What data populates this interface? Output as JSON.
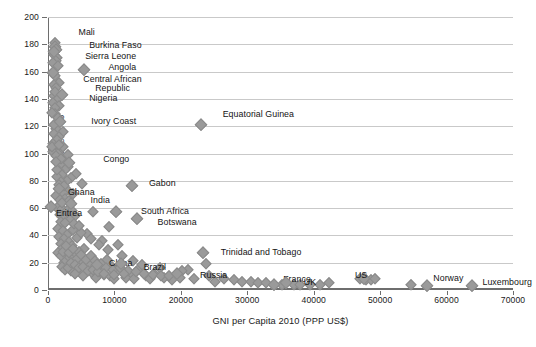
{
  "chart_data": {
    "type": "scatter",
    "title": "",
    "xlabel": "GNI per Capita 2010 (PPP US$)",
    "ylabel": "Under 5 Mortality Rate 2010",
    "xlim": [
      0,
      70000
    ],
    "ylim": [
      0,
      200
    ],
    "xticks": [
      0,
      10000,
      20000,
      30000,
      40000,
      50000,
      60000,
      70000
    ],
    "yticks": [
      0,
      20,
      40,
      60,
      80,
      100,
      120,
      140,
      160,
      180,
      200
    ],
    "xticklabels": [
      "0",
      "10000",
      "20000",
      "30000",
      "40000",
      "50000",
      "60000",
      "70000"
    ],
    "yticklabels": [
      "0",
      "20",
      "40",
      "60",
      "80",
      "100",
      "120",
      "140",
      "160",
      "180",
      "200"
    ],
    "grid": "horizontal",
    "legend": "none",
    "marker": "diamond",
    "marker_color": "#9a9a9a",
    "annotations": [
      {
        "label": "Mali",
        "x": 1030,
        "y": 178,
        "lx": 4600,
        "ly": 188,
        "align": "left"
      },
      {
        "label": "Burkina Faso",
        "x": 1250,
        "y": 176,
        "lx": 6200,
        "ly": 179,
        "align": "left"
      },
      {
        "label": "Sierra Leone",
        "x": 830,
        "y": 174,
        "lx": 5600,
        "ly": 171,
        "align": "left"
      },
      {
        "label": "Angola",
        "x": 5360,
        "y": 161,
        "lx": 9100,
        "ly": 163,
        "align": "left"
      },
      {
        "label": "Central African Republic",
        "x": 790,
        "y": 159,
        "lx": 5200,
        "ly": 154,
        "align": "left"
      },
      {
        "label": "Nigeria",
        "x": 2160,
        "y": 143,
        "lx": 6200,
        "ly": 140,
        "align": "left"
      },
      {
        "label": "Ivory Coast",
        "x": 1800,
        "y": 123,
        "lx": 6500,
        "ly": 123,
        "align": "left"
      },
      {
        "label": "Equatorial Guinea",
        "x": 23000,
        "y": 121,
        "lx": 26300,
        "ly": 128,
        "align": "left"
      },
      {
        "label": "Congo",
        "x": 3150,
        "y": 93,
        "lx": 8300,
        "ly": 95,
        "align": "left"
      },
      {
        "label": "Gabon",
        "x": 12600,
        "y": 76,
        "lx": 15200,
        "ly": 78,
        "align": "left"
      },
      {
        "label": "Ghana",
        "x": 1600,
        "y": 74,
        "lx": 3000,
        "ly": 71,
        "align": "left"
      },
      {
        "label": "India",
        "x": 3400,
        "y": 63,
        "lx": 6400,
        "ly": 65,
        "align": "left"
      },
      {
        "label": "Eritrea",
        "x": 520,
        "y": 61,
        "lx": 1200,
        "ly": 56,
        "align": "left"
      },
      {
        "label": "South Africa",
        "x": 10300,
        "y": 57,
        "lx": 14000,
        "ly": 57,
        "align": "left"
      },
      {
        "label": "Botswana",
        "x": 13400,
        "y": 52,
        "lx": 16500,
        "ly": 49,
        "align": "left"
      },
      {
        "label": "Trinidad and Tobago",
        "x": 23300,
        "y": 27,
        "lx": 26000,
        "ly": 27,
        "align": "left"
      },
      {
        "label": "China",
        "x": 7400,
        "y": 18,
        "lx": 9200,
        "ly": 19,
        "align": "left"
      },
      {
        "label": "Brazil",
        "x": 11000,
        "y": 19,
        "lx": 14400,
        "ly": 16,
        "align": "left"
      },
      {
        "label": "Russia",
        "x": 19400,
        "y": 12,
        "lx": 22900,
        "ly": 10,
        "align": "left"
      },
      {
        "label": "France",
        "x": 34000,
        "y": 4,
        "lx": 35400,
        "ly": 7,
        "align": "left"
      },
      {
        "label": "UK",
        "x": 35900,
        "y": 5,
        "lx": 38500,
        "ly": 5,
        "align": "left"
      },
      {
        "label": "US",
        "x": 47500,
        "y": 8,
        "lx": 46200,
        "ly": 10,
        "align": "left"
      },
      {
        "label": "Norway",
        "x": 57000,
        "y": 3,
        "lx": 58000,
        "ly": 8,
        "align": "left"
      },
      {
        "label": "Luxembourg",
        "x": 63800,
        "y": 3,
        "lx": 65400,
        "ly": 5,
        "align": "left"
      }
    ],
    "points": [
      [
        1030,
        178
      ],
      [
        1250,
        176
      ],
      [
        830,
        174
      ],
      [
        1100,
        181
      ],
      [
        900,
        172
      ],
      [
        1350,
        170
      ],
      [
        1150,
        168
      ],
      [
        760,
        166
      ],
      [
        1500,
        164
      ],
      [
        5360,
        161
      ],
      [
        790,
        159
      ],
      [
        1000,
        157
      ],
      [
        1700,
        152
      ],
      [
        950,
        150
      ],
      [
        1250,
        148
      ],
      [
        2160,
        143
      ],
      [
        870,
        142
      ],
      [
        1450,
        140
      ],
      [
        700,
        137
      ],
      [
        1600,
        135
      ],
      [
        1080,
        133
      ],
      [
        980,
        129
      ],
      [
        1800,
        123
      ],
      [
        23000,
        121
      ],
      [
        1150,
        118
      ],
      [
        2200,
        116
      ],
      [
        900,
        114
      ],
      [
        1600,
        112
      ],
      [
        1300,
        110
      ],
      [
        820,
        107
      ],
      [
        1050,
        104
      ],
      [
        2000,
        103
      ],
      [
        750,
        101
      ],
      [
        1450,
        100
      ],
      [
        1150,
        98
      ],
      [
        3150,
        93
      ],
      [
        2400,
        92
      ],
      [
        1900,
        91
      ],
      [
        3000,
        90
      ],
      [
        2600,
        88
      ],
      [
        1700,
        87
      ],
      [
        4200,
        85
      ],
      [
        2100,
        84
      ],
      [
        1350,
        83
      ],
      [
        3400,
        82
      ],
      [
        2800,
        80
      ],
      [
        1900,
        79
      ],
      [
        5100,
        78
      ],
      [
        1600,
        77
      ],
      [
        12600,
        76
      ],
      [
        1600,
        74
      ],
      [
        2900,
        73
      ],
      [
        2200,
        71
      ],
      [
        3700,
        70
      ],
      [
        1200,
        69
      ],
      [
        2500,
        67
      ],
      [
        1850,
        66
      ],
      [
        3100,
        65
      ],
      [
        3400,
        63
      ],
      [
        520,
        61
      ],
      [
        1400,
        60
      ],
      [
        2100,
        59
      ],
      [
        6700,
        57
      ],
      [
        10300,
        57
      ],
      [
        2700,
        56
      ],
      [
        1750,
        55
      ],
      [
        4000,
        54
      ],
      [
        2300,
        53
      ],
      [
        13400,
        52
      ],
      [
        3300,
        51
      ],
      [
        1900,
        50
      ],
      [
        2600,
        49
      ],
      [
        9200,
        46
      ],
      [
        1550,
        45
      ],
      [
        3800,
        44
      ],
      [
        2200,
        43
      ],
      [
        5900,
        41
      ],
      [
        2900,
        40
      ],
      [
        1700,
        39
      ],
      [
        4400,
        38
      ],
      [
        2400,
        37
      ],
      [
        8200,
        36
      ],
      [
        3100,
        35
      ],
      [
        1950,
        34
      ],
      [
        10500,
        33
      ],
      [
        3600,
        32
      ],
      [
        2200,
        31
      ],
      [
        5400,
        30
      ],
      [
        23300,
        27
      ],
      [
        1500,
        27
      ],
      [
        4100,
        26
      ],
      [
        2700,
        25
      ],
      [
        6500,
        24
      ],
      [
        3300,
        23
      ],
      [
        8900,
        22
      ],
      [
        4700,
        21
      ],
      [
        2400,
        20
      ],
      [
        7400,
        18
      ],
      [
        5100,
        19
      ],
      [
        3700,
        18
      ],
      [
        9600,
        17
      ],
      [
        2900,
        17
      ],
      [
        6100,
        16
      ],
      [
        11000,
        19
      ],
      [
        4400,
        15
      ],
      [
        13500,
        15
      ],
      [
        7900,
        14
      ],
      [
        3500,
        14
      ],
      [
        5600,
        13
      ],
      [
        10200,
        13
      ],
      [
        19400,
        12
      ],
      [
        16000,
        12
      ],
      [
        6800,
        12
      ],
      [
        4000,
        12
      ],
      [
        12300,
        11
      ],
      [
        8500,
        11
      ],
      [
        2600,
        22
      ],
      [
        14800,
        10
      ],
      [
        5300,
        10
      ],
      [
        9400,
        10
      ],
      [
        17500,
        9
      ],
      [
        3100,
        24
      ],
      [
        11700,
        9
      ],
      [
        7200,
        9
      ],
      [
        21000,
        15
      ],
      [
        15300,
        8
      ],
      [
        4700,
        28
      ],
      [
        6200,
        20
      ],
      [
        13000,
        8
      ],
      [
        18600,
        7
      ],
      [
        9900,
        8
      ],
      [
        23800,
        19
      ],
      [
        26500,
        8
      ],
      [
        28000,
        7
      ],
      [
        29200,
        6
      ],
      [
        30500,
        6
      ],
      [
        31600,
        5
      ],
      [
        32800,
        5
      ],
      [
        34000,
        4
      ],
      [
        35200,
        4
      ],
      [
        35900,
        5
      ],
      [
        37000,
        4
      ],
      [
        38000,
        4
      ],
      [
        39400,
        4
      ],
      [
        41000,
        4
      ],
      [
        42300,
        5
      ],
      [
        47000,
        8
      ],
      [
        47800,
        7
      ],
      [
        48600,
        7
      ],
      [
        49300,
        8
      ],
      [
        54600,
        4
      ],
      [
        57000,
        3
      ],
      [
        63800,
        3
      ],
      [
        25200,
        6
      ],
      [
        24300,
        10
      ],
      [
        22000,
        8
      ],
      [
        20200,
        14
      ],
      [
        16800,
        16
      ],
      [
        14200,
        18
      ],
      [
        12800,
        21
      ],
      [
        11200,
        25
      ],
      [
        9000,
        29
      ],
      [
        7700,
        33
      ],
      [
        6400,
        37
      ],
      [
        5000,
        42
      ],
      [
        3900,
        48
      ],
      [
        2800,
        58
      ],
      [
        2050,
        64
      ],
      [
        1400,
        88
      ],
      [
        1900,
        96
      ],
      [
        2450,
        76
      ],
      [
        3550,
        58
      ],
      [
        4600,
        47
      ],
      [
        640,
        105
      ],
      [
        600,
        130
      ],
      [
        1120,
        145
      ],
      [
        1550,
        126
      ],
      [
        880,
        121
      ],
      [
        2300,
        105
      ],
      [
        1250,
        94
      ],
      [
        3000,
        99
      ],
      [
        1700,
        106
      ],
      [
        2000,
        25
      ],
      [
        2300,
        28
      ],
      [
        2700,
        32
      ],
      [
        3200,
        27
      ],
      [
        3800,
        30
      ],
      [
        4300,
        23
      ],
      [
        5000,
        26
      ],
      [
        5700,
        22
      ],
      [
        6400,
        25
      ],
      [
        7100,
        21
      ],
      [
        8000,
        19
      ],
      [
        8800,
        16
      ],
      [
        9800,
        15
      ],
      [
        10800,
        16
      ],
      [
        12000,
        14
      ],
      [
        13200,
        13
      ],
      [
        14500,
        12
      ],
      [
        15800,
        11
      ],
      [
        17000,
        10
      ],
      [
        18200,
        10
      ],
      [
        19800,
        9
      ],
      [
        2100,
        17
      ],
      [
        2500,
        15
      ],
      [
        3000,
        16
      ],
      [
        3400,
        20
      ],
      [
        4000,
        18
      ],
      [
        4600,
        16
      ],
      [
        5300,
        17
      ],
      [
        6000,
        14
      ],
      [
        6800,
        15
      ],
      [
        7600,
        13
      ],
      [
        8400,
        12
      ],
      [
        10000,
        11
      ],
      [
        11500,
        12
      ]
    ]
  },
  "figure": {
    "caption": ""
  }
}
